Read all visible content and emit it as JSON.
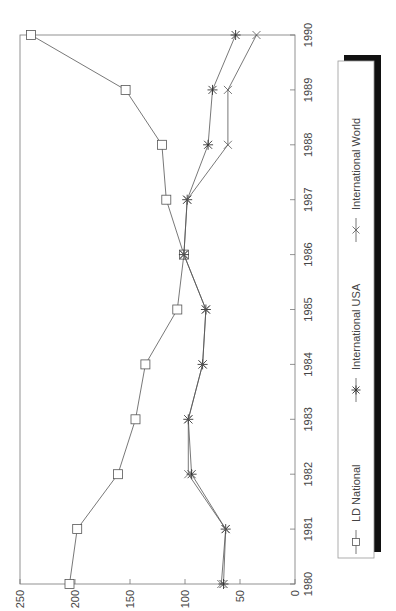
{
  "chart_data": {
    "type": "line",
    "title": "",
    "xlabel": "",
    "ylabel": "",
    "orientation": "rotated-90-clockwise",
    "categories": [
      "1980",
      "1981",
      "1982",
      "1983",
      "1984",
      "1985",
      "1986",
      "1987",
      "1988",
      "1989",
      "1990"
    ],
    "ylim": [
      0,
      250
    ],
    "yticks": [
      "250",
      "200",
      "150",
      "100",
      "50",
      "0"
    ],
    "grid": false,
    "legend_position": "right (bottom in unrotated frame)",
    "series": [
      {
        "name": "LD National",
        "marker": "square",
        "values": [
          205,
          198,
          161,
          145,
          136,
          107,
          101,
          117,
          121,
          154,
          240
        ]
      },
      {
        "name": "International USA",
        "marker": "asterisk",
        "values": [
          65,
          63,
          94,
          97,
          84,
          81,
          101,
          98,
          79,
          75,
          54
        ]
      },
      {
        "name": "International World",
        "marker": "x-cross",
        "values": [
          67,
          63,
          97,
          97,
          84,
          81,
          101,
          98,
          61,
          61,
          35
        ]
      }
    ]
  },
  "colors": {
    "line": "#555555",
    "axis": "#777777",
    "legend_shadow": "#111111"
  },
  "legend": {
    "items": [
      {
        "label": "LD National"
      },
      {
        "label": "International USA"
      },
      {
        "label": "International World"
      }
    ]
  }
}
